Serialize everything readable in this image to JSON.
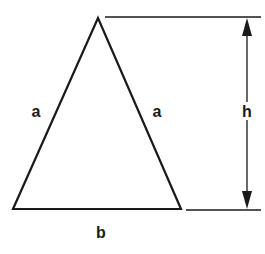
{
  "diagram": {
    "labels": {
      "left_side": "a",
      "right_side": "a",
      "height": "h",
      "base": "b"
    },
    "colors": {
      "stroke": "#1a1a1a",
      "background": "#ffffff"
    }
  }
}
